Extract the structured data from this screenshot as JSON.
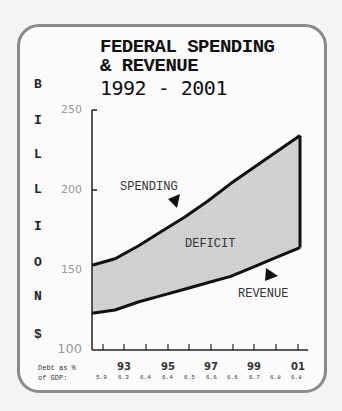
{
  "title": {
    "line1": "FEDERAL SPENDING",
    "line2": "& REVENUE",
    "line3": "1992 - 2001"
  },
  "ylabel_letters": [
    "B",
    "I",
    "L",
    "L",
    "I",
    "O",
    "N",
    "$"
  ],
  "annotations": {
    "spending": "SPENDING",
    "deficit": "DEFICIT",
    "revenue": "REVENUE"
  },
  "footer": {
    "label_line1": "Debt as %",
    "label_line2": "of GDP:",
    "values": [
      "5.9",
      "6.3",
      "6.4",
      "6.4",
      "6.5",
      "6.6",
      "6.6",
      "6.7",
      "6.8",
      "6.8"
    ]
  },
  "colors": {
    "fill": "#d4d4d4",
    "line": "#111111",
    "frame": "#8a8a8a"
  },
  "chart_data": {
    "type": "area",
    "title": "FEDERAL SPENDING & REVENUE 1992 - 2001",
    "xlabel": "",
    "ylabel": "BILLION $",
    "x": [
      1992,
      1993,
      1994,
      1995,
      1996,
      1997,
      1998,
      1999,
      2000,
      2001
    ],
    "xtick_labels": [
      "93",
      "95",
      "97",
      "99",
      "01"
    ],
    "ytick_labels": [
      "100",
      "150",
      "200",
      "250"
    ],
    "ylim": [
      100,
      250
    ],
    "grid": false,
    "series": [
      {
        "name": "Spending",
        "values": [
          153,
          157,
          165,
          174,
          183,
          193,
          204,
          214,
          224,
          234
        ]
      },
      {
        "name": "Revenue",
        "values": [
          123,
          125,
          130,
          134,
          138,
          142,
          146,
          152,
          158,
          164
        ]
      }
    ],
    "shaded_region": "Deficit (between Spending and Revenue)",
    "annotations": [
      "SPENDING",
      "DEFICIT",
      "REVENUE"
    ],
    "footer_row": {
      "label": "Debt as % of GDP:",
      "values": [
        5.9,
        6.3,
        6.4,
        6.4,
        6.5,
        6.6,
        6.6,
        6.7,
        6.8,
        6.8
      ]
    }
  }
}
